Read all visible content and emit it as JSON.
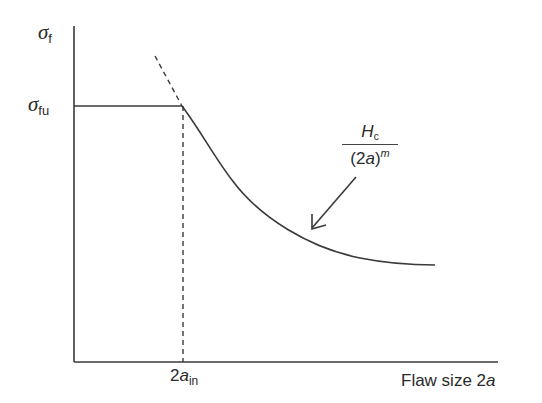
{
  "diagram": {
    "y_axis_label": {
      "symbol": "σ",
      "subscript": "f"
    },
    "level_label": {
      "symbol": "σ",
      "subscript": "fu"
    },
    "x_tick_label": {
      "base": "2",
      "var": "a",
      "subscript": "in"
    },
    "x_axis_label": {
      "text": "Flaw size 2",
      "var": "a"
    },
    "curve_formula": {
      "numerator_var": "H",
      "numerator_sub": "c",
      "denominator_base": "(2",
      "denominator_var": "a",
      "denominator_close": ")",
      "denominator_exp": "m"
    },
    "colors": {
      "line": "#3a3a3a",
      "background": "#ffffff"
    }
  }
}
